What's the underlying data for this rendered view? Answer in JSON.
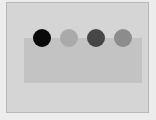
{
  "canvas": {
    "background": "#ececec",
    "panel_color": "#d5d5d5",
    "panel_border": "#b8b8b8",
    "rectangle_color": "#c3c3c3"
  },
  "circles": [
    {
      "id": "circle-1",
      "color": "#0a0a0a",
      "cx": 42,
      "cy": 38
    },
    {
      "id": "circle-2",
      "color": "#aaaaaa",
      "cx": 69,
      "cy": 38
    },
    {
      "id": "circle-3",
      "color": "#464646",
      "cx": 96,
      "cy": 38
    },
    {
      "id": "circle-4",
      "color": "#8c8c8c",
      "cx": 123,
      "cy": 38
    }
  ]
}
